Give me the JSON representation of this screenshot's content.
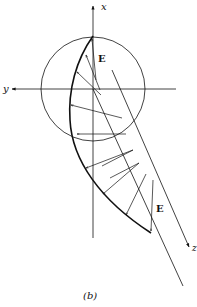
{
  "figure": {
    "caption": "(b)",
    "axes": {
      "x_label": "x",
      "y_label": "y",
      "z_label": "z"
    },
    "field_labels": {
      "top": "E",
      "bottom": "E"
    },
    "colors": {
      "ink": "#111111",
      "background": "#ffffff"
    }
  }
}
